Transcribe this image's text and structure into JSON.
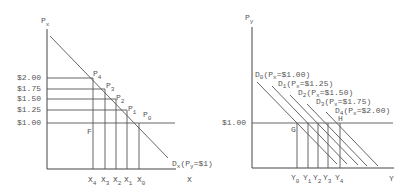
{
  "left_panel": {
    "y_axis_label": "P",
    "y_axis_label_sub": "x",
    "x_axis_label": "X",
    "price_ticks": [
      "$2.00",
      "$1.75",
      "$1.50",
      "$1.25",
      "$1.00"
    ],
    "points": [
      {
        "label": "P",
        "sub": "4"
      },
      {
        "label": "P",
        "sub": "3"
      },
      {
        "label": "P",
        "sub": "2"
      },
      {
        "label": "P",
        "sub": "1"
      },
      {
        "label": "P",
        "sub": "0"
      }
    ],
    "point_f": "F",
    "quantity_ticks": [
      {
        "label": "X",
        "sub": "4"
      },
      {
        "label": "X",
        "sub": "3"
      },
      {
        "label": "X",
        "sub": "2"
      },
      {
        "label": "X",
        "sub": "1"
      },
      {
        "label": "X",
        "sub": "0"
      }
    ],
    "demand_label": "D",
    "demand_label_sub": "x",
    "demand_condition": "(P",
    "demand_condition_sub": "y",
    "demand_condition_rest": "=$1)"
  },
  "right_panel": {
    "y_axis_label": "P",
    "y_axis_label_sub": "y",
    "x_axis_label": "Y",
    "price_tick": "$1.00",
    "point_g": "G",
    "point_h": "H",
    "demand_curves": [
      {
        "label": "D",
        "sub": "0",
        "cond": "(P",
        "cond_sub": "x",
        "cond_rest": "=$1.00)"
      },
      {
        "label": "D",
        "sub": "1",
        "cond": "(P",
        "cond_sub": "x",
        "cond_rest": "=$1.25)"
      },
      {
        "label": "D",
        "sub": "2",
        "cond": "(P",
        "cond_sub": "x",
        "cond_rest": "=$1.50)"
      },
      {
        "label": "D",
        "sub": "3",
        "cond": "(P",
        "cond_sub": "x",
        "cond_rest": "=$1.75)"
      },
      {
        "label": "D",
        "sub": "4",
        "cond": "(P",
        "cond_sub": "x",
        "cond_rest": "=$2.00)"
      }
    ],
    "quantity_ticks": [
      {
        "label": "Y",
        "sub": "0"
      },
      {
        "label": "Y",
        "sub": "1"
      },
      {
        "label": "Y",
        "sub": "2"
      },
      {
        "label": "Y",
        "sub": "3"
      },
      {
        "label": "Y",
        "sub": "4"
      }
    ]
  }
}
